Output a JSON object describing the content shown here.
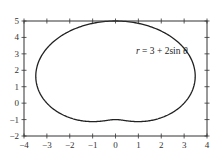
{
  "chart_data": {
    "type": "line",
    "title": "",
    "xlabel": "",
    "ylabel": "",
    "xlim": [
      -4,
      4
    ],
    "ylim": [
      -2,
      5
    ],
    "grid": false,
    "xticks": [
      -4,
      -3,
      -2,
      -1,
      0,
      1,
      2,
      3,
      4
    ],
    "yticks": [
      -2,
      -1,
      0,
      1,
      2,
      3,
      4,
      5
    ],
    "xtick_labels": [
      "−4",
      "−3",
      "−2",
      "−1",
      "0",
      "1",
      "2",
      "3",
      "4"
    ],
    "ytick_labels": [
      "−2",
      "−1",
      "0",
      "1",
      "2",
      "3",
      "4",
      "5"
    ],
    "annotation": "r = 3 + 2sin θ",
    "series": [
      {
        "name": "r = 3 + 2sin θ",
        "kind": "polar",
        "equation": "r = 3 + 2 sin(theta)",
        "theta_range": [
          0,
          6.2832
        ],
        "color": "#222222"
      }
    ],
    "legend": null
  }
}
